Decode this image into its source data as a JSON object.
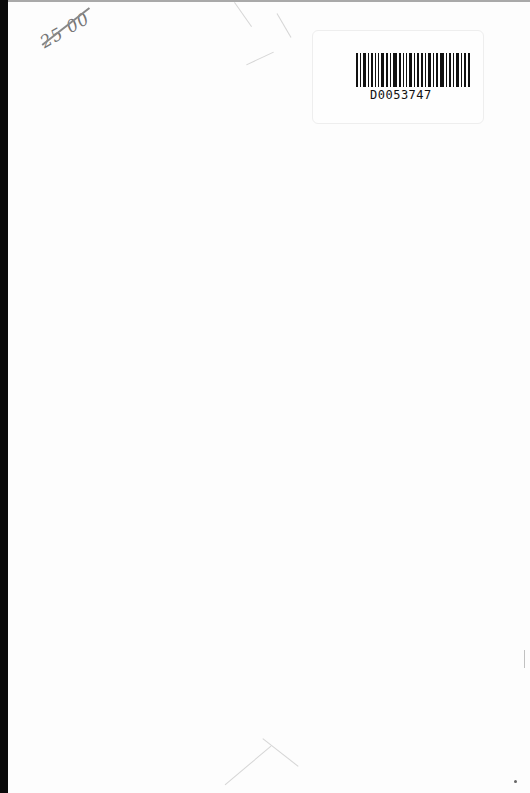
{
  "page": {
    "type": "scanned-book-endpaper",
    "background": "#fdfdfd",
    "spine_color": "#0a0a0a"
  },
  "annotations": {
    "handwritten_price": "25 00"
  },
  "barcode": {
    "label_text": "D0053747",
    "bar_widths": [
      2,
      1,
      3,
      1,
      2,
      1,
      1,
      3,
      2,
      1,
      4,
      2,
      1,
      1,
      3,
      1,
      2,
      2,
      1,
      3,
      1,
      2,
      4,
      1,
      2,
      1,
      3,
      1,
      2,
      2
    ]
  }
}
